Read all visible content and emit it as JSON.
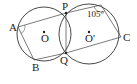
{
  "diagram": {
    "type": "geometry",
    "circles": [
      {
        "name": "O",
        "label": "O",
        "cx": 44,
        "cy": 34,
        "r": 27
      },
      {
        "name": "O-prime",
        "label": "O'",
        "cx": 89,
        "cy": 34,
        "r": 30
      }
    ],
    "points": {
      "A": {
        "label": "A",
        "x": 18,
        "y": 27
      },
      "B": {
        "label": "B",
        "x": 34,
        "y": 60
      },
      "P": {
        "label": "P",
        "x": 66,
        "y": 13
      },
      "Q": {
        "label": "Q",
        "x": 66,
        "y": 53
      },
      "C": {
        "label": "C",
        "x": 121,
        "y": 37
      },
      "D": {
        "label": "",
        "x": 101,
        "y": 5
      }
    },
    "segments": [
      [
        "A",
        "P"
      ],
      [
        "A",
        "B"
      ],
      [
        "B",
        "Q"
      ],
      [
        "P",
        "Q"
      ],
      [
        "P",
        "D"
      ],
      [
        "D",
        "C"
      ],
      [
        "Q",
        "C"
      ]
    ],
    "angle_annotation": {
      "text": "105°",
      "at": "D"
    },
    "labels": {
      "A": "A",
      "B": "B",
      "P": "P",
      "Q": "Q",
      "C": "C",
      "O": "O",
      "O_prime": "O'",
      "angle": "105°"
    },
    "colors": {
      "stroke": "#333333",
      "background": "#ffffff"
    }
  }
}
